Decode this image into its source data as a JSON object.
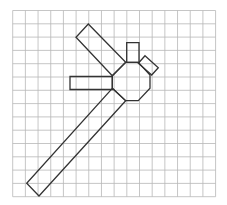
{
  "diagram": {
    "type": "grid-drawing",
    "grid": {
      "columns": 16,
      "rows": 14,
      "x0": 12.7,
      "y0": 10.5,
      "cell_width": 12.68,
      "cell_height": 13.3,
      "line_color": "#b8b8b8"
    },
    "stroke_color": "#333333",
    "shapes": [
      {
        "name": "octagon-body",
        "points": [
          [
            125.7,
            62.3
          ],
          [
            138.3,
            62.3
          ],
          [
            150,
            75
          ],
          [
            150,
            88.3
          ],
          [
            138.3,
            100.7
          ],
          [
            125.7,
            100.7
          ],
          [
            112.3,
            88.3
          ],
          [
            112.3,
            75.7
          ]
        ]
      },
      {
        "name": "upper-diagonal-panel",
        "points": [
          [
            88.3,
            24
          ],
          [
            125.7,
            62.3
          ],
          [
            112.3,
            75.7
          ],
          [
            76,
            37.3
          ]
        ]
      },
      {
        "name": "left-horizontal-panel",
        "points": [
          [
            70,
            76.5
          ],
          [
            112.3,
            76.5
          ],
          [
            112.3,
            89.5
          ],
          [
            70,
            89.5
          ]
        ]
      },
      {
        "name": "top-small-rect",
        "points": [
          [
            126.7,
            42.7
          ],
          [
            139,
            42.7
          ],
          [
            139,
            62.3
          ],
          [
            126.7,
            62.3
          ]
        ]
      },
      {
        "name": "right-small-tilted-rect",
        "points": [
          [
            145,
            55.7
          ],
          [
            158.3,
            67.7
          ],
          [
            151.7,
            75
          ],
          [
            138.3,
            63.3
          ]
        ]
      },
      {
        "name": "long-lower-diagonal-panel",
        "points": [
          [
            112.3,
            88.3
          ],
          [
            125.7,
            100.7
          ],
          [
            39,
            196
          ],
          [
            26.7,
            183.3
          ]
        ]
      }
    ]
  }
}
